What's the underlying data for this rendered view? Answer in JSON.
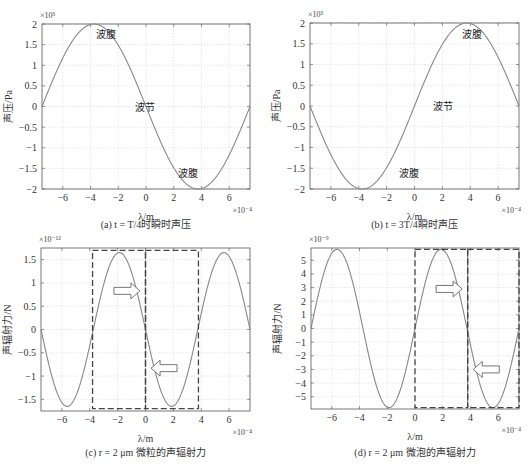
{
  "figure": {
    "panels": [
      {
        "id": "a",
        "caption": "(a) t = T/4时瞬时声压",
        "ylabel": "声压/Pa",
        "xlabel": "λ/m",
        "y_exponent": "×10⁵",
        "x_exponent": "×10⁻⁴",
        "annotations": [
          {
            "text": "波腹",
            "x": -3.6,
            "y": 1.65
          },
          {
            "text": "波节",
            "x": -0.8,
            "y": -0.1
          },
          {
            "text": "波腹",
            "x": 2.3,
            "y": -1.7
          }
        ]
      },
      {
        "id": "b",
        "caption": "(b) t = 3T/4瞬时声压",
        "ylabel": "声压/Pa",
        "xlabel": "λ/m",
        "y_exponent": "×10⁵",
        "x_exponent": "×10⁻⁴",
        "annotations": [
          {
            "text": "波腹",
            "x": 3.4,
            "y": 1.65
          },
          {
            "text": "波节",
            "x": 1.3,
            "y": -0.1
          },
          {
            "text": "波腹",
            "x": -1.1,
            "y": -1.7
          }
        ]
      },
      {
        "id": "c",
        "caption": "(c) r = 2 μm 微粒的声辐射力",
        "ylabel": "声辐射力/N",
        "xlabel": "λ/m",
        "y_exponent": "×10⁻¹²",
        "x_exponent": "×10⁻⁴"
      },
      {
        "id": "d",
        "caption": "(d) r = 2 μm 微泡的声辐射力",
        "ylabel": "声辐射力/N",
        "xlabel": "λ/m",
        "y_exponent": "×10⁻⁹",
        "x_exponent": "×10⁻⁴"
      }
    ]
  },
  "chart_data": [
    {
      "type": "line",
      "title": "(a) t = T/4时瞬时声压",
      "xlabel": "λ/m (×10⁻⁴)",
      "ylabel": "声压/Pa (×10⁵)",
      "xlim": [
        -7.5,
        7.5
      ],
      "ylim": [
        -2,
        2
      ],
      "xticks": [
        -6,
        -4,
        -2,
        0,
        2,
        4,
        6
      ],
      "yticks": [
        -2,
        -1.5,
        -1,
        -0.5,
        0,
        0.5,
        1,
        1.5,
        2
      ],
      "grid": true,
      "color": "#888888",
      "x": [
        -7.5,
        -6,
        -4,
        -3.75,
        -2,
        0,
        2,
        3.75,
        4,
        6,
        7.5
      ],
      "values": [
        0,
        1.18,
        1.99,
        2.0,
        1.49,
        0,
        -1.49,
        -2.0,
        -1.99,
        -1.18,
        0
      ],
      "amplitude": 2,
      "period": 15,
      "sign": -1,
      "annotations": [
        "波腹",
        "波节",
        "波腹"
      ]
    },
    {
      "type": "line",
      "title": "(b) t = 3T/4瞬时声压",
      "xlabel": "λ/m (×10⁻⁴)",
      "ylabel": "声压/Pa (×10⁵)",
      "xlim": [
        -7.5,
        7.5
      ],
      "ylim": [
        -2,
        2
      ],
      "xticks": [
        -6,
        -4,
        -2,
        0,
        2,
        4,
        6
      ],
      "yticks": [
        -2,
        -1.5,
        -1,
        -0.5,
        0,
        0.5,
        1,
        1.5,
        2
      ],
      "grid": true,
      "color": "#888888",
      "x": [
        -7.5,
        -6,
        -4,
        -3.75,
        -2,
        0,
        2,
        3.75,
        4,
        6,
        7.5
      ],
      "values": [
        0,
        -1.18,
        -1.99,
        -2.0,
        -1.49,
        0,
        1.49,
        2.0,
        1.99,
        1.18,
        0
      ],
      "amplitude": 2,
      "period": 15,
      "sign": 1,
      "annotations": [
        "波腹",
        "波节",
        "波腹"
      ]
    },
    {
      "type": "line",
      "title": "(c) r = 2 μm 微粒的声辐射力",
      "xlabel": "λ/m (×10⁻⁴)",
      "ylabel": "声辐射力/N (×10⁻¹²)",
      "xlim": [
        -7.5,
        7.5
      ],
      "ylim": [
        -1.75,
        1.75
      ],
      "xticks": [
        -6,
        -4,
        -2,
        0,
        2,
        4,
        6
      ],
      "yticks": [
        -1.5,
        -1,
        -0.5,
        0,
        0.5,
        1,
        1.5
      ],
      "grid": true,
      "color": "#888888",
      "x": [
        -7.5,
        -5.625,
        -3.75,
        -1.875,
        0,
        1.875,
        3.75,
        5.625,
        7.5
      ],
      "values": [
        0,
        -1.65,
        0,
        1.65,
        0,
        -1.65,
        0,
        1.65,
        0
      ],
      "amplitude": 1.65,
      "period": 7.5,
      "sign": -1,
      "dashed_boxes": [
        {
          "x0": -3.8,
          "x1": 0,
          "y0": -1.7,
          "y1": 1.7
        },
        {
          "x0": 0,
          "x1": 3.8,
          "y0": -1.7,
          "y1": 1.7
        }
      ],
      "arrows": [
        {
          "dir": "right",
          "x": -0.4,
          "y": 0.83
        },
        {
          "dir": "left",
          "x": 0.4,
          "y": -0.83
        }
      ]
    },
    {
      "type": "line",
      "title": "(d) r = 2 μm 微泡的声辐射力",
      "xlabel": "λ/m (×10⁻⁴)",
      "ylabel": "声辐射力/N (×10⁻⁹)",
      "xlim": [
        -7.5,
        7.5
      ],
      "ylim": [
        -5.9,
        5.9
      ],
      "xticks": [
        -6,
        -4,
        -2,
        0,
        2,
        4,
        6
      ],
      "yticks": [
        -5,
        -4,
        -3,
        -2,
        -1,
        0,
        1,
        2,
        3,
        4,
        5
      ],
      "grid": true,
      "color": "#888888",
      "x": [
        -7.5,
        -5.625,
        -3.75,
        -1.875,
        0,
        1.875,
        3.75,
        5.625,
        7.5
      ],
      "values": [
        0,
        5.8,
        0,
        -5.8,
        0,
        5.8,
        0,
        -5.8,
        0
      ],
      "amplitude": 5.8,
      "period": 7.5,
      "sign": 1,
      "dashed_boxes": [
        {
          "x0": 0,
          "x1": 3.8,
          "y0": -5.8,
          "y1": 5.8
        },
        {
          "x0": 3.8,
          "x1": 7.5,
          "y0": -5.8,
          "y1": 5.8
        }
      ],
      "arrows": [
        {
          "dir": "right",
          "x": 3.4,
          "y": 2.9
        },
        {
          "dir": "left",
          "x": 4.2,
          "y": -3.0
        }
      ]
    }
  ]
}
